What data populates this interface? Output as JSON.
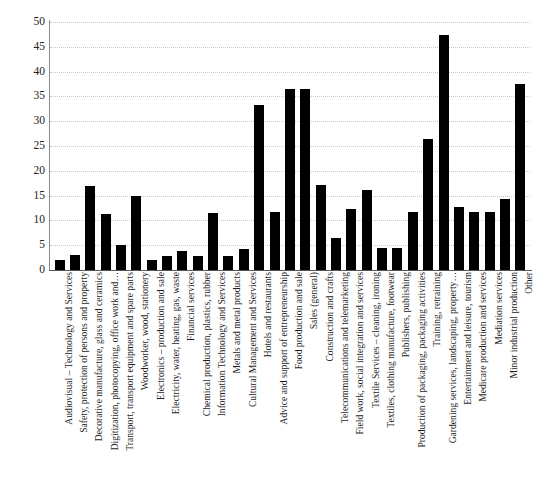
{
  "chart_data": {
    "type": "bar",
    "title": "",
    "subtitle": "",
    "xlabel": "",
    "ylabel": "",
    "ylim": [
      0,
      50
    ],
    "ytick_step": 5,
    "yticks": [
      0,
      5,
      10,
      15,
      20,
      25,
      30,
      35,
      40,
      45,
      50
    ],
    "grid": true,
    "legend": "none",
    "bar_color": "#000000",
    "categories": [
      "Audiovisual – Technology and Services",
      "Safety, protection of persons and property",
      "Decorative manufacture, glass and ceramics",
      "Digitization, photocopying, office work and…",
      "Transport, transport equipment and spare parts",
      "Woodworker, wood, stationery",
      "Electronics – production and sale",
      "Electricity, water, heating, gas, waste",
      "Financial services",
      "Chemical production, plastics, rubber",
      "Information Technology and Services",
      "Metals and metal products",
      "Cultural Management and Services",
      "Hotels and restaurants",
      "Advice and support of entrepreneurship",
      "Food production and sale",
      "Sales (general)",
      "Construction and crafts",
      "Telecommunications and telemarketing",
      "Field work, social integration and services",
      "Textile Services – cleaning, ironing",
      "Textiles, clothing manufacture, footwear",
      "Publishers, publishing",
      "Production of packaging, packaging activities",
      "Training, retraining",
      "Gardening services, landscaping, property…",
      "Entertainment and leisure, tourism",
      "Medicare production and services",
      "Mediation services",
      "Minor industrial production",
      "Other"
    ],
    "values": [
      2.0,
      3.0,
      17.0,
      11.2,
      5.0,
      15.0,
      2.0,
      2.8,
      3.8,
      2.9,
      11.4,
      2.8,
      4.2,
      33.3,
      11.6,
      36.4,
      36.4,
      17.2,
      6.4,
      12.4,
      16.2,
      4.4,
      4.4,
      11.6,
      26.4,
      47.4,
      12.7,
      11.6,
      11.6,
      14.3,
      37.5
    ]
  },
  "caption": {
    "text": ""
  }
}
